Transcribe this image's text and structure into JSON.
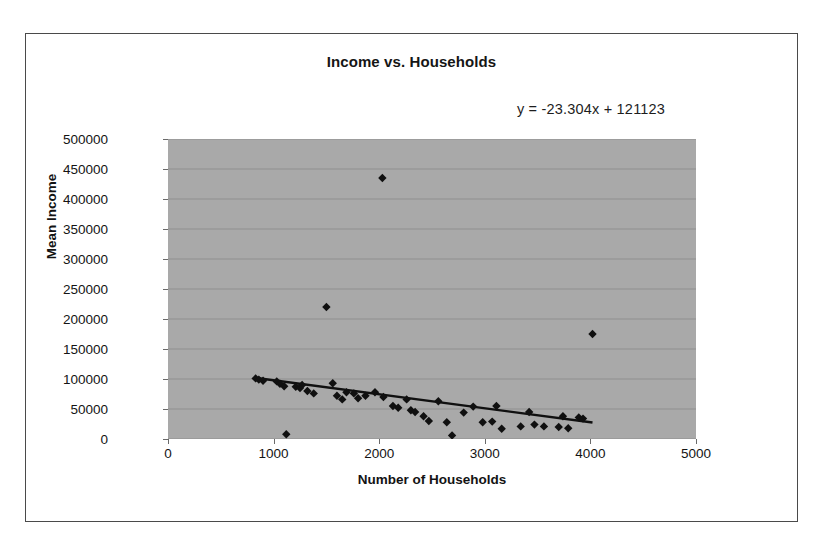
{
  "chart_data": {
    "type": "scatter",
    "title": "Income vs. Households",
    "xlabel": "Number of Households",
    "ylabel": "Mean Income",
    "xlim": [
      0,
      5000
    ],
    "ylim": [
      0,
      500000
    ],
    "xticks": [
      0,
      1000,
      2000,
      3000,
      4000,
      5000
    ],
    "yticks": [
      0,
      50000,
      100000,
      150000,
      200000,
      250000,
      300000,
      350000,
      400000,
      450000,
      500000
    ],
    "xtick_labels": [
      "0",
      "1000",
      "2000",
      "3000",
      "4000",
      "5000"
    ],
    "ytick_labels": [
      "0",
      "50000",
      "100000",
      "150000",
      "200000",
      "250000",
      "300000",
      "350000",
      "400000",
      "450000",
      "500000"
    ],
    "grid": "horizontal",
    "legend": "none",
    "plot_background": "#a9a9a9",
    "marker": "diamond",
    "marker_color": "#101010",
    "trendline": {
      "type": "linear",
      "equation": "y = -23.304x + 121123",
      "slope": -23.304,
      "intercept": 121123,
      "x_start": 820,
      "x_end": 4020,
      "color": "#101010"
    },
    "points": [
      {
        "x": 830,
        "y": 101000
      },
      {
        "x": 860,
        "y": 99000
      },
      {
        "x": 900,
        "y": 97000
      },
      {
        "x": 1030,
        "y": 96000
      },
      {
        "x": 1060,
        "y": 92000
      },
      {
        "x": 1100,
        "y": 88000
      },
      {
        "x": 1120,
        "y": 8000
      },
      {
        "x": 1210,
        "y": 87000
      },
      {
        "x": 1250,
        "y": 85000
      },
      {
        "x": 1270,
        "y": 90000
      },
      {
        "x": 1320,
        "y": 80000
      },
      {
        "x": 1380,
        "y": 76000
      },
      {
        "x": 1500,
        "y": 220000
      },
      {
        "x": 1560,
        "y": 93000
      },
      {
        "x": 1600,
        "y": 72000
      },
      {
        "x": 1650,
        "y": 66000
      },
      {
        "x": 1690,
        "y": 78000
      },
      {
        "x": 1760,
        "y": 76000
      },
      {
        "x": 1800,
        "y": 68000
      },
      {
        "x": 1870,
        "y": 72000
      },
      {
        "x": 1960,
        "y": 78000
      },
      {
        "x": 2030,
        "y": 435000
      },
      {
        "x": 2040,
        "y": 70000
      },
      {
        "x": 2130,
        "y": 55000
      },
      {
        "x": 2180,
        "y": 52000
      },
      {
        "x": 2260,
        "y": 66000
      },
      {
        "x": 2300,
        "y": 48000
      },
      {
        "x": 2340,
        "y": 45000
      },
      {
        "x": 2420,
        "y": 38000
      },
      {
        "x": 2470,
        "y": 30000
      },
      {
        "x": 2560,
        "y": 63000
      },
      {
        "x": 2640,
        "y": 28000
      },
      {
        "x": 2690,
        "y": 6000
      },
      {
        "x": 2800,
        "y": 44000
      },
      {
        "x": 2890,
        "y": 54000
      },
      {
        "x": 2980,
        "y": 28000
      },
      {
        "x": 3070,
        "y": 29000
      },
      {
        "x": 3110,
        "y": 55000
      },
      {
        "x": 3160,
        "y": 17000
      },
      {
        "x": 3340,
        "y": 21000
      },
      {
        "x": 3420,
        "y": 45000
      },
      {
        "x": 3470,
        "y": 24000
      },
      {
        "x": 3560,
        "y": 21000
      },
      {
        "x": 3700,
        "y": 20000
      },
      {
        "x": 3740,
        "y": 38000
      },
      {
        "x": 3790,
        "y": 18000
      },
      {
        "x": 3890,
        "y": 36000
      },
      {
        "x": 3930,
        "y": 34000
      },
      {
        "x": 4020,
        "y": 175000
      }
    ]
  }
}
